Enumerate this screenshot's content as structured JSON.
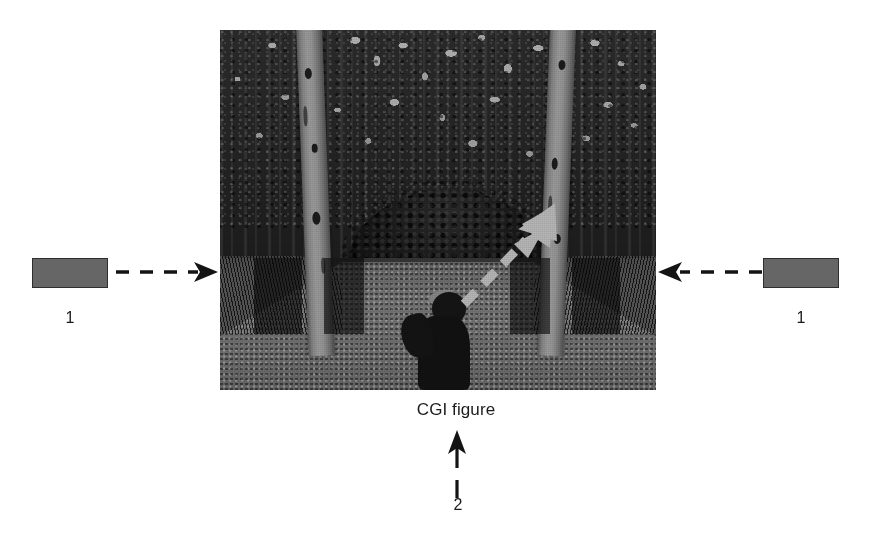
{
  "figure": {
    "type": "patent-illustration",
    "caption": "CGI figure",
    "callouts": [
      {
        "id": "left-1",
        "label": "1",
        "pointer": "dashed-arrow-right",
        "target": "dark-rectangular-region-left"
      },
      {
        "id": "right-1",
        "label": "1",
        "pointer": "dashed-arrow-left",
        "target": "dark-rectangular-region-right"
      },
      {
        "id": "bottom-2",
        "label": "2",
        "pointer": "dashed-arrow-up",
        "target": "cgi-figure"
      }
    ],
    "swatches": {
      "left_label": "1",
      "right_label": "1",
      "color": "#4e4e4e"
    },
    "photo": {
      "description": "Halftone black-and-white forest photograph",
      "scene_elements": [
        "birch tree trunk left",
        "birch tree trunk right",
        "dense dark forest background",
        "central dark bush",
        "gravel path",
        "dark silhouetted CGI figure on path",
        "white dashed arrow pointing up-right into bush",
        "dark rectangular overlay regions"
      ],
      "overlay_arrow": {
        "style": "white-dashed",
        "direction": "up-right",
        "color": "#ffffff"
      }
    },
    "colors": {
      "ink": "#1a1a1a",
      "paper": "#ffffff",
      "swatch": "#4e4e4e",
      "overlay_arrow": "#ffffff"
    }
  }
}
